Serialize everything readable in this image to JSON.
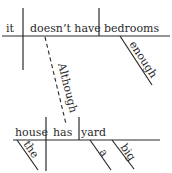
{
  "diagram": {
    "type": "sentence-diagram",
    "main_clause": {
      "subject": "it",
      "verb": "doesn’t have",
      "object": "bedrooms",
      "object_modifier": "enough"
    },
    "connector": "Although",
    "subordinate_clause": {
      "subject": "house",
      "subject_modifier": "the",
      "verb": "has",
      "object": "yard",
      "object_modifiers": [
        "a",
        "big"
      ]
    }
  }
}
